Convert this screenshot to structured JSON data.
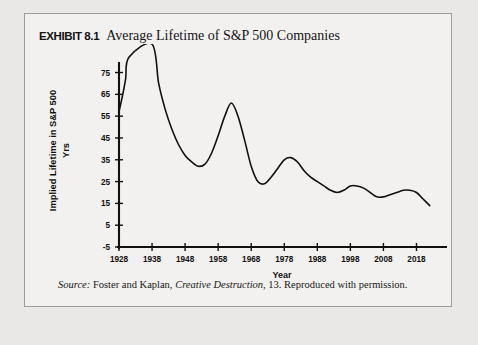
{
  "exhibit": {
    "label": "EXHIBIT 8.1",
    "title": "Average Lifetime of S&P 500 Companies",
    "source_prefix": "Source:",
    "source_author": "Foster and Kaplan,",
    "source_work": "Creative Destruction",
    "source_rest": ", 13. Reproduced with permission."
  },
  "colors": {
    "page_background": "#e9e8e6",
    "panel_background": "#f2f1ef",
    "panel_border": "#9d9b97",
    "axis": "#111111",
    "line": "#111111",
    "text": "#141414"
  },
  "chart_data": {
    "type": "line",
    "title": "Average Lifetime of S&P 500 Companies",
    "xlabel": "Year",
    "ylabel": "Implied Lifetime in S&P 500",
    "ylabel_units": "Yrs",
    "xlim": [
      1928,
      2023
    ],
    "ylim": [
      -5,
      78
    ],
    "grid": false,
    "legend": false,
    "xticks": [
      1928,
      1938,
      1948,
      1958,
      1968,
      1978,
      1988,
      1998,
      2008,
      2018
    ],
    "xtick_labels": [
      "1928",
      "1938",
      "1948",
      "1958",
      "1968",
      "1978",
      "1988",
      "1998",
      "2008",
      "2018"
    ],
    "yticks": [
      -5,
      5,
      15,
      25,
      35,
      45,
      55,
      65,
      75
    ],
    "ytick_labels": [
      "-5",
      "5",
      "15",
      "25",
      "35",
      "45",
      "55",
      "65",
      "75"
    ],
    "series": [
      {
        "name": "Implied Lifetime in S&P 500",
        "x": [
          1928,
          1929,
          1930,
          1931,
          1938,
          1940,
          1942,
          1944,
          1946,
          1948,
          1950,
          1952,
          1954,
          1956,
          1958,
          1960,
          1962,
          1964,
          1966,
          1968,
          1970,
          1972,
          1974,
          1976,
          1978,
          1980,
          1982,
          1984,
          1986,
          1988,
          1990,
          1992,
          1994,
          1996,
          1998,
          2000,
          2002,
          2004,
          2006,
          2008,
          2010,
          2012,
          2014,
          2016,
          2018,
          2020,
          2022
        ],
        "values": [
          57,
          64,
          72,
          82,
          88,
          70,
          58,
          49,
          42,
          37,
          34,
          32,
          33,
          38,
          46,
          55,
          61,
          55,
          44,
          32,
          25,
          24,
          27,
          31,
          35,
          36,
          34,
          30,
          27,
          25,
          23,
          21,
          20,
          21,
          23,
          23,
          22,
          20,
          18,
          18,
          19,
          20,
          21,
          21,
          20,
          17,
          14
        ]
      }
    ]
  }
}
